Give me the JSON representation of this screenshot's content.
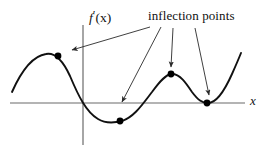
{
  "figure": {
    "name": "inflection-points-derivative-graph",
    "width": 275,
    "height": 152,
    "background_color": "#ffffff",
    "curve_color": "#111111",
    "axis_color": "#6b6b6b",
    "arrow_color": "#2a2a2a",
    "dot_color": "#000000"
  },
  "labels": {
    "annotation": "inflection points",
    "y_axis": {
      "function": "f",
      "prime": "′",
      "argument": "(x)",
      "full": "f′(x)"
    },
    "x_axis": "x"
  },
  "chart_data": {
    "type": "line",
    "title": "",
    "subtitle": "",
    "xlabel": "x",
    "ylabel": "f'(x)",
    "grid": false,
    "legend": null,
    "axes": {
      "x_axis_y_px": 103,
      "y_axis_x_px": 83,
      "x_axis_extent_px": [
        10,
        245
      ],
      "y_axis_extent_px": [
        25,
        145
      ]
    },
    "curve_path": "M 12,92 C 20,74 32,56 46,54 C 56,52 64,63 70,76 C 78,95 86,112 98,119 C 106,124 114,123 122,121 C 134,117 142,105 152,92 C 160,81 166,74 172,74 C 180,74 186,83 192,92 C 198,100 202,103 208,103 C 216,103 224,92 232,74 C 236,65 239,58 241,53",
    "points": [
      {
        "label": "local maximum",
        "x_px": 58,
        "y_px": 56,
        "on_axis": false
      },
      {
        "label": "local minimum",
        "x_px": 120,
        "y_px": 121,
        "on_axis": false
      },
      {
        "label": "local maximum",
        "x_px": 171,
        "y_px": 74,
        "on_axis": false
      },
      {
        "label": "local minimum on axis",
        "x_px": 207,
        "y_px": 103,
        "on_axis": true
      }
    ],
    "annotations": [
      {
        "text": "inflection points",
        "arrows": [
          {
            "from_x": 150,
            "from_y": 27,
            "to_x": 72,
            "to_y": 50
          },
          {
            "from_x": 161,
            "from_y": 27,
            "to_x": 122,
            "to_y": 102
          },
          {
            "from_x": 173,
            "from_y": 28,
            "to_x": 171,
            "to_y": 67
          },
          {
            "from_x": 195,
            "from_y": 28,
            "to_x": 209,
            "to_y": 95
          }
        ]
      }
    ]
  }
}
